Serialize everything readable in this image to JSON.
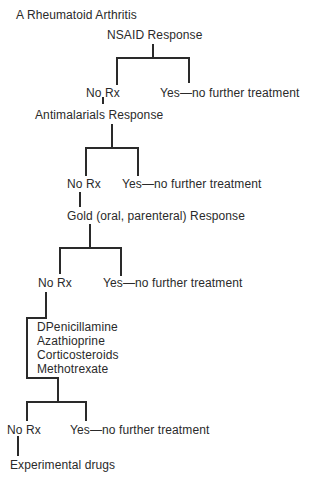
{
  "figure": {
    "title": "A Rheumatoid Arthritis",
    "levels": [
      {
        "node": "NSAID Response",
        "no_branch": "No Rx",
        "yes_branch": "Yes—no further treatment"
      },
      {
        "node": "Antimalarials Response",
        "no_branch": "No Rx",
        "yes_branch": "Yes—no further treatment"
      },
      {
        "node": "Gold (oral, parenteral) Response",
        "no_branch": "No Rx",
        "yes_branch": "Yes—no further treatment"
      },
      {
        "node_group": [
          "DPenicillamine",
          "Azathioprine",
          "Corticosteroids",
          "Methotrexate"
        ],
        "no_branch": "No Rx",
        "yes_branch": "Yes—no further treatment"
      }
    ],
    "final": "Experimental drugs"
  }
}
